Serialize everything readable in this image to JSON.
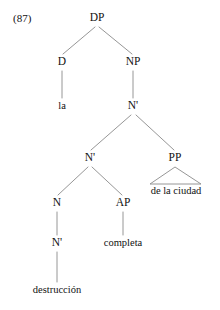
{
  "figure": {
    "example_number": "(87)",
    "language": "Spanish",
    "line_color": "#8a8a8a",
    "text_color": "#111111",
    "background_color": "#ffffff"
  },
  "tree": {
    "nodes": [
      {
        "id": "dp",
        "label": "DP",
        "x": 97,
        "y": 18,
        "kind": "category"
      },
      {
        "id": "d",
        "label": "D",
        "x": 62,
        "y": 62,
        "kind": "category"
      },
      {
        "id": "np",
        "label": "NP",
        "x": 133,
        "y": 62,
        "kind": "category"
      },
      {
        "id": "nbar1",
        "label": "N'",
        "x": 133,
        "y": 106,
        "kind": "category"
      },
      {
        "id": "nbar2",
        "label": "N'",
        "x": 90,
        "y": 158,
        "kind": "category"
      },
      {
        "id": "pp",
        "label": "PP",
        "x": 175,
        "y": 158,
        "kind": "category"
      },
      {
        "id": "n",
        "label": "N",
        "x": 57,
        "y": 203,
        "kind": "category"
      },
      {
        "id": "ap",
        "label": "AP",
        "x": 123,
        "y": 203,
        "kind": "category"
      },
      {
        "id": "nbar3",
        "label": "N'",
        "x": 57,
        "y": 243,
        "kind": "category"
      }
    ],
    "leaves": [
      {
        "id": "la",
        "label": "la",
        "x": 62,
        "y": 106
      },
      {
        "id": "de-la-ciudad",
        "label": "de la ciudad",
        "x": 176,
        "y": 191
      },
      {
        "id": "completa",
        "label": "completa",
        "x": 123,
        "y": 243
      },
      {
        "id": "destruccion",
        "label": "destrucción",
        "x": 57,
        "y": 290
      }
    ],
    "edges": [
      {
        "id": "dp-d",
        "from": "dp",
        "to": "d",
        "x1": 95,
        "y1": 27,
        "x2": 63,
        "y2": 54
      },
      {
        "id": "dp-np",
        "from": "dp",
        "to": "np",
        "x1": 99,
        "y1": 27,
        "x2": 132,
        "y2": 54
      },
      {
        "id": "d-la",
        "from": "d",
        "to": "la",
        "x1": 62,
        "y1": 71,
        "x2": 62,
        "y2": 98
      },
      {
        "id": "np-nbar1",
        "from": "np",
        "to": "nbar1",
        "x1": 133,
        "y1": 71,
        "x2": 133,
        "y2": 98
      },
      {
        "id": "nbar1-nbar2",
        "from": "nbar1",
        "to": "nbar2",
        "x1": 131,
        "y1": 115,
        "x2": 91,
        "y2": 150
      },
      {
        "id": "nbar1-pp",
        "from": "nbar1",
        "to": "pp",
        "x1": 136,
        "y1": 115,
        "x2": 174,
        "y2": 150
      },
      {
        "id": "nbar2-n",
        "from": "nbar2",
        "to": "n",
        "x1": 88,
        "y1": 167,
        "x2": 58,
        "y2": 195
      },
      {
        "id": "nbar2-ap",
        "from": "nbar2",
        "to": "ap",
        "x1": 92,
        "y1": 167,
        "x2": 122,
        "y2": 195
      },
      {
        "id": "n-nbar3",
        "from": "n",
        "to": "nbar3",
        "x1": 57,
        "y1": 212,
        "x2": 57,
        "y2": 235
      },
      {
        "id": "ap-completa",
        "from": "ap",
        "to": "completa",
        "x1": 123,
        "y1": 212,
        "x2": 123,
        "y2": 235
      },
      {
        "id": "nbar3-destruccion",
        "from": "nbar3",
        "to": "destruccion",
        "x1": 57,
        "y1": 252,
        "x2": 57,
        "y2": 282
      }
    ],
    "triangles": [
      {
        "id": "pp-triangle",
        "parent": "pp",
        "leaf": "de-la-ciudad",
        "apex_x": 175,
        "apex_y": 167,
        "left_x": 150,
        "right_x": 201,
        "base_y": 184
      }
    ]
  },
  "reading": {
    "surface_string": "la destrucción completa de la ciudad",
    "terminals": [
      "la",
      "destrucción",
      "completa",
      "de la ciudad"
    ]
  }
}
